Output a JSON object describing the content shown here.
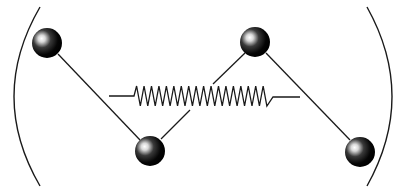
{
  "diagram": {
    "type": "mechanical-model",
    "colors": {
      "background": "#ffffff",
      "stroke": "#1a1a1a",
      "sphere_dark": "#000000",
      "sphere_highlight": "#ffffff"
    },
    "spheres": [
      {
        "id": "sphere-1",
        "cx": 47,
        "cy": 43,
        "r": 15
      },
      {
        "id": "sphere-2",
        "cx": 150,
        "cy": 151,
        "r": 15
      },
      {
        "id": "sphere-3",
        "cx": 255,
        "cy": 42,
        "r": 15
      },
      {
        "id": "sphere-4",
        "cx": 360,
        "cy": 152,
        "r": 15
      }
    ],
    "rods": [
      {
        "id": "rod-1-2",
        "x1": 58,
        "y1": 54,
        "x2": 140,
        "y2": 140
      },
      {
        "id": "rod-2-spring",
        "x1": 161,
        "y1": 139,
        "x2": 190,
        "y2": 110
      },
      {
        "id": "rod-3-spring",
        "x1": 245,
        "y1": 53,
        "x2": 213,
        "y2": 84
      },
      {
        "id": "rod-3-4",
        "x1": 266,
        "y1": 53,
        "x2": 350,
        "y2": 140
      }
    ],
    "spring": {
      "lead_left": {
        "x1": 109,
        "y1": 96,
        "x2": 134,
        "y2": 96
      },
      "zigzag_start_x": 134,
      "zigzag_end_x": 268,
      "top_y": 86,
      "bottom_y": 106,
      "peaks": 18,
      "lead_right": {
        "x1": 273,
        "y1": 97,
        "x2": 300,
        "y2": 97
      }
    },
    "brackets": {
      "left": {
        "x_top": 40,
        "y_top": 7,
        "x_mid": 14,
        "x_bottom": 40,
        "y_bottom": 186
      },
      "right": {
        "x_top": 367,
        "y_top": 7,
        "x_mid": 392,
        "x_bottom": 367,
        "y_bottom": 186
      }
    }
  }
}
